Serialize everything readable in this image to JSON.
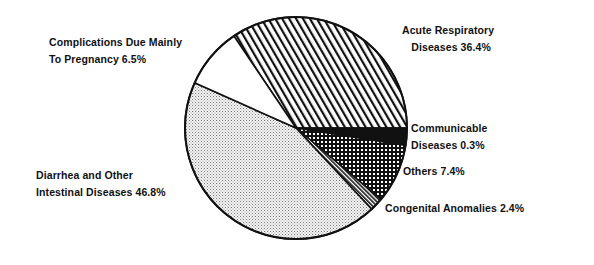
{
  "chart_data": {
    "type": "pie",
    "title": "",
    "categories": [
      "Acute Respiratory Diseases",
      "Communicable Diseases",
      "Others",
      "Congenital Anomalies",
      "Diarrhea and Other Intestinal Diseases",
      "Complications Due Mainly To Pregnancy"
    ],
    "values": [
      36.4,
      0.3,
      7.4,
      2.4,
      46.8,
      6.5
    ],
    "unit": "%",
    "patterns": [
      "diagonal-hatch",
      "solid-black",
      "crosshatch-grid",
      "dense-diagonal-hatch",
      "fine-dots",
      "white"
    ],
    "legend": "none (direct labels)"
  },
  "labels": {
    "acute_line1": "Acute Respiratory",
    "acute_line2": "Diseases 36.4%",
    "communicable_line1": "Communicable",
    "communicable_line2": "Diseases 0.3%",
    "others": "Others 7.4%",
    "congenital": "Congenital Anomalies 2.4%",
    "diarrhea_line1": "Diarrhea and Other",
    "diarrhea_line2": "Intestinal Diseases 46.8%",
    "pregnancy_line1": "Complications Due Mainly",
    "pregnancy_line2": "To Pregnancy 6.5%"
  }
}
